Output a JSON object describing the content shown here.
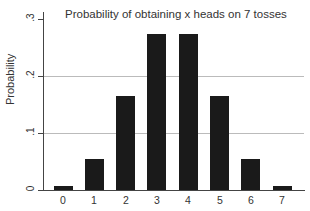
{
  "chart_data": {
    "type": "bar",
    "title": "Probability of obtaining x heads on 7 tosses",
    "xlabel": "",
    "ylabel": "Probability",
    "categories": [
      "0",
      "1",
      "2",
      "3",
      "4",
      "5",
      "6",
      "7"
    ],
    "values": [
      0.0078,
      0.0547,
      0.1641,
      0.2734,
      0.2734,
      0.1641,
      0.0547,
      0.0078
    ],
    "ylim": [
      0,
      0.3
    ],
    "yticks": [
      0,
      0.1,
      0.2,
      0.3
    ],
    "ytick_labels": [
      "0",
      ".1",
      ".2",
      ".3"
    ],
    "grid": true,
    "legend": null,
    "bar_color": "#1a1a1a"
  }
}
